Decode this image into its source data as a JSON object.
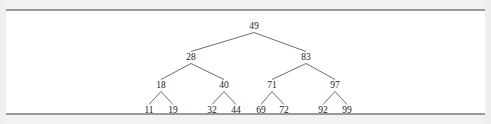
{
  "figure": {
    "kind": "binary-search-tree-diagram",
    "background_color": "#ffffff",
    "page_color": "#efefef",
    "rule_color": "#9a9a9a",
    "edge_color": "#5d5d5d",
    "text_color": "#1a1a1a"
  },
  "chart_data": {
    "type": "diagram",
    "title": "",
    "xlabel": "",
    "ylabel": "",
    "levels": 4,
    "nodes": [
      {
        "id": "n49",
        "label": "49",
        "level": 0,
        "x": 248,
        "y": 18
      },
      {
        "id": "n28",
        "label": "28",
        "level": 1,
        "x": 185,
        "y": 49
      },
      {
        "id": "n83",
        "label": "83",
        "level": 1,
        "x": 300,
        "y": 49
      },
      {
        "id": "n18",
        "label": "18",
        "level": 2,
        "x": 155,
        "y": 77
      },
      {
        "id": "n40",
        "label": "40",
        "level": 2,
        "x": 218,
        "y": 77
      },
      {
        "id": "n71",
        "label": "71",
        "level": 2,
        "x": 266,
        "y": 77
      },
      {
        "id": "n97",
        "label": "97",
        "level": 2,
        "x": 329,
        "y": 77
      },
      {
        "id": "n11",
        "label": "11",
        "level": 3,
        "x": 143,
        "y": 102
      },
      {
        "id": "n19",
        "label": "19",
        "level": 3,
        "x": 167,
        "y": 102
      },
      {
        "id": "n32",
        "label": "32",
        "level": 3,
        "x": 206,
        "y": 102
      },
      {
        "id": "n44",
        "label": "44",
        "level": 3,
        "x": 230,
        "y": 102
      },
      {
        "id": "n69",
        "label": "69",
        "level": 3,
        "x": 255,
        "y": 102
      },
      {
        "id": "n72",
        "label": "72",
        "level": 3,
        "x": 278,
        "y": 102
      },
      {
        "id": "n92",
        "label": "92",
        "level": 3,
        "x": 317,
        "y": 102
      },
      {
        "id": "n99",
        "label": "99",
        "level": 3,
        "x": 341,
        "y": 102
      }
    ],
    "edges": [
      {
        "from": "n49",
        "to": "n28"
      },
      {
        "from": "n49",
        "to": "n83"
      },
      {
        "from": "n28",
        "to": "n18"
      },
      {
        "from": "n28",
        "to": "n40"
      },
      {
        "from": "n83",
        "to": "n71"
      },
      {
        "from": "n83",
        "to": "n97"
      },
      {
        "from": "n18",
        "to": "n11"
      },
      {
        "from": "n18",
        "to": "n19"
      },
      {
        "from": "n40",
        "to": "n32"
      },
      {
        "from": "n40",
        "to": "n44"
      },
      {
        "from": "n71",
        "to": "n69"
      },
      {
        "from": "n71",
        "to": "n72"
      },
      {
        "from": "n97",
        "to": "n92"
      },
      {
        "from": "n97",
        "to": "n99"
      }
    ]
  }
}
